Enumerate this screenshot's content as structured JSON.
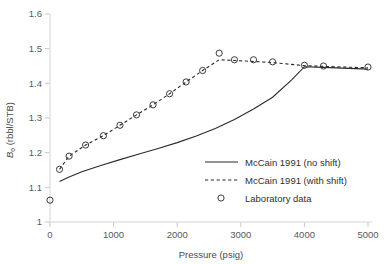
{
  "chart_data": {
    "type": "scatter",
    "title": "",
    "xlabel": "Pressure (psig)",
    "ylabel": "Bo (rbbl/STB)",
    "ylabel_main": "B",
    "ylabel_sub": "o",
    "ylabel_rest": " (rbbl/STB)",
    "xlim": [
      0,
      5000
    ],
    "ylim": [
      1.0,
      1.6
    ],
    "xticks": [
      0,
      1000,
      2000,
      3000,
      4000,
      5000
    ],
    "xtick_labels": [
      "0",
      "1000",
      "2000",
      "3000",
      "4000",
      "5000"
    ],
    "yticks": [
      1.0,
      1.1,
      1.2,
      1.3,
      1.4,
      1.5,
      1.6
    ],
    "ytick_labels": [
      "1",
      "1.1",
      "1.2",
      "1.3",
      "1.4",
      "1.5",
      "1.6"
    ],
    "grid": false,
    "legend_position": "inside-right-lower",
    "series": [
      {
        "name": "McCain 1991 (no shift)",
        "style": "solid",
        "x": [
          150,
          300,
          500,
          800,
          1100,
          1400,
          1700,
          2000,
          2300,
          2600,
          2900,
          3200,
          3500,
          3800,
          4000,
          4300,
          4600,
          5000
        ],
        "values": [
          1.117,
          1.13,
          1.145,
          1.163,
          1.18,
          1.196,
          1.212,
          1.229,
          1.248,
          1.27,
          1.296,
          1.326,
          1.36,
          1.41,
          1.448,
          1.446,
          1.444,
          1.441
        ]
      },
      {
        "name": "McCain 1991 (with shift)",
        "style": "dashed",
        "x": [
          150,
          300,
          560,
          840,
          1100,
          1360,
          1620,
          1880,
          2140,
          2400,
          2660,
          2900,
          3200,
          3500,
          4000,
          4300,
          4600,
          5000
        ],
        "values": [
          1.152,
          1.19,
          1.222,
          1.249,
          1.279,
          1.309,
          1.338,
          1.37,
          1.404,
          1.437,
          1.468,
          1.466,
          1.463,
          1.46,
          1.451,
          1.449,
          1.447,
          1.445
        ]
      },
      {
        "name": "Laboratory data",
        "style": "markers",
        "x": [
          0,
          150,
          300,
          560,
          840,
          1100,
          1360,
          1620,
          1880,
          2140,
          2400,
          2660,
          2900,
          3200,
          3500,
          4000,
          4300,
          5000
        ],
        "values": [
          1.063,
          1.152,
          1.19,
          1.222,
          1.249,
          1.279,
          1.309,
          1.338,
          1.37,
          1.404,
          1.437,
          1.487,
          1.468,
          1.468,
          1.462,
          1.452,
          1.45,
          1.447
        ]
      }
    ],
    "legend": [
      {
        "label": "McCain 1991 (no shift)",
        "style": "solid"
      },
      {
        "label": "McCain 1991 (with shift)",
        "style": "dashed"
      },
      {
        "label": "Laboratory data",
        "style": "marker"
      }
    ]
  }
}
